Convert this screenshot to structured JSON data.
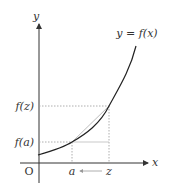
{
  "diagram": {
    "curve_label": "y = f(x)",
    "axes": {
      "x_label": "x",
      "y_label": "y",
      "origin_label": "O"
    },
    "x_ticks": [
      {
        "label": "a"
      },
      {
        "label": "z"
      }
    ],
    "y_ticks": [
      {
        "label": "f(z)"
      },
      {
        "label": "f(a)"
      }
    ],
    "arrow": {
      "from": "z",
      "to": "a",
      "direction": "left"
    },
    "colors": {
      "axis": "#333333",
      "curve": "#222222",
      "dotted": "#999999",
      "secant": "#aaaaaa"
    }
  }
}
